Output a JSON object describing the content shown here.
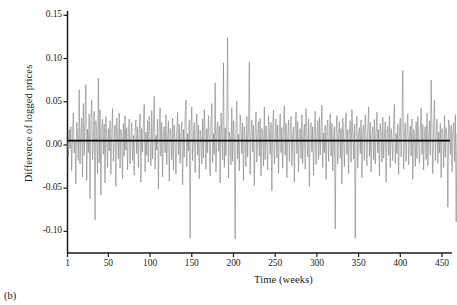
{
  "panel": {
    "label": "(b)"
  },
  "chart_data": {
    "type": "line",
    "title": "",
    "xlabel": "Time (weeks)",
    "ylabel": "Difference of logged prices",
    "xlim": [
      1,
      462
    ],
    "ylim": [
      -0.125,
      0.155
    ],
    "grid": false,
    "legend": null,
    "xticks": [
      1,
      50,
      100,
      150,
      200,
      250,
      300,
      350,
      400,
      450
    ],
    "xticklabels": [
      "1",
      "50",
      "100",
      "150",
      "200",
      "250",
      "300",
      "350",
      "400",
      "450"
    ],
    "yticks": [
      0.15,
      0.1,
      0.05,
      0.0,
      -0.05,
      -0.1
    ],
    "yticklabels": [
      "0.15",
      "0.10",
      "0.05",
      "0.00",
      "-0.05",
      "-0.10"
    ],
    "reference_line": {
      "y": 0.005,
      "color": "#000000",
      "width": 1.6
    },
    "series": [
      {
        "name": "Difference of logged prices",
        "color": "#808080",
        "width": 0.6,
        "x_start": 1,
        "x_step": 1,
        "values": [
          0.002,
          -0.013,
          0.018,
          -0.004,
          0.021,
          -0.03,
          0.012,
          0.037,
          -0.009,
          0.004,
          -0.045,
          0.026,
          0.014,
          -0.018,
          0.064,
          -0.022,
          0.009,
          0.031,
          -0.037,
          0.048,
          -0.012,
          0.026,
          0.07,
          -0.041,
          0.018,
          -0.009,
          0.036,
          -0.062,
          0.022,
          0.052,
          -0.017,
          0.009,
          0.039,
          -0.087,
          0.028,
          0.013,
          -0.033,
          0.077,
          -0.021,
          0.041,
          -0.058,
          0.016,
          0.03,
          -0.011,
          0.024,
          -0.044,
          0.033,
          0.007,
          -0.026,
          0.019,
          -0.007,
          0.028,
          -0.034,
          0.012,
          0.042,
          -0.019,
          0.006,
          0.023,
          -0.048,
          0.031,
          0.011,
          -0.016,
          0.037,
          -0.027,
          0.018,
          0.009,
          -0.039,
          0.025,
          -0.013,
          0.034,
          -0.006,
          0.02,
          -0.029,
          0.014,
          0.03,
          -0.022,
          0.008,
          0.026,
          -0.018,
          0.011,
          -0.035,
          0.017,
          0.029,
          -0.01,
          0.021,
          -0.026,
          0.013,
          0.036,
          -0.043,
          0.019,
          -0.008,
          0.024,
          0.047,
          -0.031,
          0.015,
          -0.012,
          0.028,
          -0.02,
          0.033,
          0.009,
          -0.024,
          0.04,
          -0.016,
          0.022,
          0.056,
          -0.028,
          0.011,
          -0.006,
          0.03,
          -0.051,
          0.017,
          0.043,
          -0.013,
          0.026,
          -0.037,
          0.014,
          0.021,
          -0.009,
          0.035,
          -0.023,
          0.008,
          0.028,
          -0.042,
          0.019,
          0.012,
          -0.017,
          0.031,
          -0.029,
          0.023,
          0.006,
          -0.034,
          0.016,
          0.038,
          -0.011,
          0.024,
          -0.021,
          0.009,
          0.027,
          -0.046,
          0.018,
          -0.014,
          0.033,
          0.052,
          -0.025,
          0.013,
          -0.007,
          0.029,
          -0.108,
          0.021,
          0.044,
          -0.018,
          0.01,
          0.026,
          -0.032,
          0.015,
          0.036,
          -0.012,
          0.023,
          -0.039,
          0.017,
          0.008,
          -0.022,
          0.03,
          -0.015,
          0.041,
          0.011,
          -0.028,
          0.019,
          -0.009,
          0.034,
          0.006,
          -0.036,
          0.025,
          0.048,
          -0.02,
          0.013,
          -0.011,
          0.072,
          -0.031,
          0.016,
          0.027,
          -0.007,
          0.022,
          -0.044,
          0.037,
          0.012,
          -0.017,
          0.095,
          -0.026,
          0.02,
          -0.013,
          0.031,
          0.124,
          -0.038,
          0.015,
          0.009,
          -0.023,
          0.043,
          -0.019,
          0.028,
          0.007,
          -0.109,
          0.024,
          0.051,
          -0.016,
          0.012,
          -0.03,
          0.035,
          0.018,
          -0.01,
          0.026,
          -0.041,
          0.021,
          0.006,
          -0.025,
          0.033,
          -0.014,
          0.017,
          0.096,
          -0.034,
          0.011,
          0.029,
          -0.008,
          0.023,
          -0.047,
          0.016,
          0.038,
          -0.02,
          0.009,
          0.027,
          -0.013,
          0.031,
          -0.036,
          0.019,
          0.012,
          -0.024,
          0.044,
          -0.017,
          0.022,
          0.007,
          -0.029,
          0.034,
          0.015,
          -0.011,
          0.026,
          -0.053,
          0.018,
          0.04,
          -0.022,
          0.01,
          0.03,
          -0.015,
          0.023,
          -0.033,
          0.013,
          0.036,
          -0.009,
          0.02,
          -0.027,
          0.017,
          0.045,
          -0.012,
          0.025,
          -0.038,
          0.008,
          0.029,
          -0.019,
          0.014,
          0.033,
          -0.024,
          0.011,
          0.021,
          -0.043,
          0.016,
          0.038,
          -0.01,
          0.027,
          -0.031,
          0.013,
          0.019,
          -0.016,
          0.035,
          -0.021,
          0.009,
          0.024,
          -0.028,
          0.042,
          0.012,
          -0.014,
          0.03,
          -0.048,
          0.018,
          0.026,
          -0.008,
          0.021,
          -0.035,
          0.015,
          0.039,
          -0.023,
          0.01,
          0.028,
          -0.017,
          0.032,
          -0.012,
          0.02,
          0.046,
          -0.026,
          0.014,
          -0.009,
          0.023,
          -0.04,
          0.017,
          0.029,
          -0.019,
          0.011,
          0.036,
          -0.013,
          0.025,
          -0.03,
          0.008,
          0.021,
          -0.097,
          0.016,
          0.034,
          -0.022,
          0.012,
          0.027,
          -0.015,
          0.019,
          -0.045,
          0.031,
          0.009,
          -0.025,
          0.022,
          0.037,
          -0.011,
          0.018,
          -0.033,
          0.014,
          0.028,
          -0.02,
          0.041,
          0.01,
          -0.016,
          0.024,
          -0.108,
          0.017,
          0.033,
          -0.027,
          0.013,
          0.02,
          -0.01,
          0.029,
          -0.038,
          0.015,
          0.023,
          -0.018,
          0.035,
          0.009,
          -0.024,
          0.019,
          0.044,
          -0.013,
          0.026,
          -0.031,
          0.011,
          0.021,
          -0.017,
          0.03,
          -0.022,
          0.014,
          0.038,
          -0.009,
          0.018,
          -0.036,
          0.025,
          0.012,
          -0.02,
          0.032,
          -0.015,
          0.01,
          0.027,
          -0.043,
          0.016,
          0.022,
          -0.012,
          0.034,
          -0.026,
          0.019,
          0.008,
          -0.018,
          0.029,
          0.047,
          -0.021,
          0.013,
          -0.01,
          0.024,
          -0.034,
          0.017,
          0.031,
          -0.014,
          0.02,
          0.086,
          -0.028,
          0.011,
          0.026,
          -0.019,
          0.015,
          0.036,
          -0.023,
          0.009,
          0.022,
          -0.013,
          0.03,
          -0.04,
          0.018,
          0.012,
          -0.025,
          0.027,
          -0.016,
          0.033,
          0.01,
          -0.021,
          0.019,
          0.043,
          -0.011,
          0.024,
          -0.029,
          0.014,
          0.021,
          -0.017,
          0.037,
          -0.024,
          0.008,
          0.028,
          -0.012,
          0.075,
          0.016,
          -0.033,
          0.022,
          0.052,
          -0.018,
          0.011,
          0.03,
          -0.021,
          0.015,
          -0.009,
          0.025,
          -0.038,
          0.019,
          0.013,
          -0.026,
          0.034,
          -0.014,
          0.02,
          0.009,
          -0.072,
          0.029,
          0.017,
          -0.011,
          0.023,
          -0.031,
          0.012,
          0.026,
          -0.019,
          0.035,
          -0.089,
          0.014
        ]
      }
    ]
  }
}
